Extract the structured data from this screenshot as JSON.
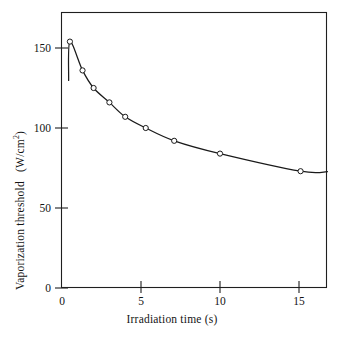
{
  "chart_data": {
    "type": "line",
    "title": "",
    "xlabel": "Irradiation time (s)",
    "ylabel_text": "Vaporization  threshold",
    "ylabel_units": "(W/cm",
    "ylabel_units_exp": "2",
    "ylabel_units_close": ")",
    "ylabel": "Vaporization threshold (W/cm2)",
    "xlim": [
      0,
      16.8
    ],
    "ylim": [
      0,
      172
    ],
    "xticks": [
      0,
      5,
      10,
      15
    ],
    "xtick_labels": [
      "0",
      "5",
      "10",
      "15"
    ],
    "yticks": [
      0,
      50,
      100,
      150
    ],
    "ytick_labels": [
      "0",
      "50",
      "100",
      "150"
    ],
    "grid": false,
    "legend": "none",
    "marker": "open-circle",
    "series": [
      {
        "name": "Vaporization threshold",
        "x": [
          0.5,
          1.3,
          2.0,
          3.0,
          4.0,
          5.3,
          7.1,
          10.0,
          15.1
        ],
        "values": [
          154,
          136,
          125,
          116,
          107,
          100,
          92,
          84,
          73
        ]
      }
    ],
    "curve_x_start": 0.42,
    "curve_x_end": 16.8
  }
}
